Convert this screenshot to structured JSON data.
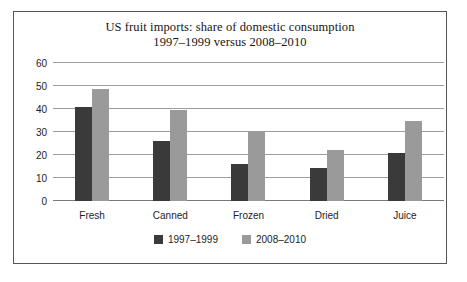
{
  "chart_data": {
    "type": "bar",
    "title": "US fruit imports: share of domestic consumption\n1997–1999 versus 2008–2010",
    "title_lines": [
      "US fruit imports: share of domestic consumption",
      "1997–1999 versus 2008–2010"
    ],
    "categories": [
      "Fresh",
      "Canned",
      "Frozen",
      "Dried",
      "Juice"
    ],
    "series": [
      {
        "name": "1997–1999",
        "color": "#3a3a3a",
        "values": [
          41,
          26,
          16,
          14.5,
          21
        ]
      },
      {
        "name": "2008–2010",
        "color": "#9a9a9a",
        "values": [
          48.5,
          39.5,
          30.5,
          22,
          35
        ]
      }
    ],
    "xlabel": "",
    "ylabel": "",
    "ylim": [
      0,
      60
    ],
    "yticks": [
      0,
      10,
      20,
      30,
      40,
      50,
      60
    ],
    "ytick_labels": [
      "0",
      "10",
      "20",
      "30",
      "40",
      "50",
      "60"
    ],
    "grid": true,
    "legend_position": "bottom",
    "gridline_color": "#9d9d9d",
    "border_color": "#555555",
    "background_color": "#ffffff"
  }
}
